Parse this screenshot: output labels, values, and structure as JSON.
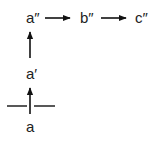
{
  "diagram": {
    "nodes": [
      {
        "id": "a_dprime",
        "label": "a″"
      },
      {
        "id": "b_dprime",
        "label": "b″"
      },
      {
        "id": "c_dprime",
        "label": "c″"
      },
      {
        "id": "a_prime",
        "label": "a′"
      },
      {
        "id": "a",
        "label": "a"
      }
    ],
    "edges": [
      {
        "from": "a",
        "to": "a_prime",
        "direction": "up",
        "crosses_horizontal_line": true
      },
      {
        "from": "a_prime",
        "to": "a_dprime",
        "direction": "up"
      },
      {
        "from": "a_dprime",
        "to": "b_dprime",
        "direction": "right"
      },
      {
        "from": "b_dprime",
        "to": "c_dprime",
        "direction": "right"
      }
    ],
    "horizontal_line": {
      "description": "horizontal barrier line crossed by the arrow from a to a′"
    },
    "colors": {
      "stroke": "#111111",
      "text": "#222222",
      "background": "#ffffff"
    }
  }
}
